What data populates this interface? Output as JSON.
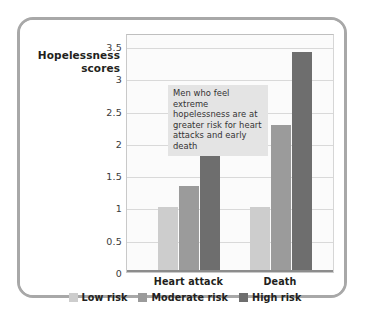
{
  "chart_data": {
    "type": "bar",
    "title": "",
    "xlabel": "",
    "ylabel": "Hopelessness scores",
    "ylabel_lines": [
      "Hopelessness",
      "scores"
    ],
    "categories": [
      "Heart attack",
      "Death"
    ],
    "series": [
      {
        "name": "Low risk",
        "color": "#cdcdcd",
        "values": [
          1.0,
          1.0
        ]
      },
      {
        "name": "Moderate risk",
        "color": "#9b9b9b",
        "values": [
          1.33,
          2.27
        ]
      },
      {
        "name": "High risk",
        "color": "#6e6e6e",
        "values": [
          2.35,
          3.4
        ]
      }
    ],
    "ylim": [
      0,
      3.7
    ],
    "yticks": [
      0,
      0.5,
      1,
      1.5,
      2,
      2.5,
      3,
      3.5
    ],
    "ytick_labels": [
      "0",
      "0.5",
      "1",
      "1.5",
      "2",
      "2.5",
      "3",
      "3.5"
    ],
    "grid": true,
    "legend_position": "bottom",
    "annotations": [
      {
        "text": "Men who feel extreme hopelessness are at greater risk for heart attacks and early death",
        "lines": [
          "Men who feel extreme",
          "hopelessness are at",
          "greater risk for heart",
          "attacks and early death"
        ],
        "background": "#e4e4e4"
      }
    ]
  },
  "frame": {
    "border_color": "#a8a8a8",
    "background": "#ffffff"
  }
}
